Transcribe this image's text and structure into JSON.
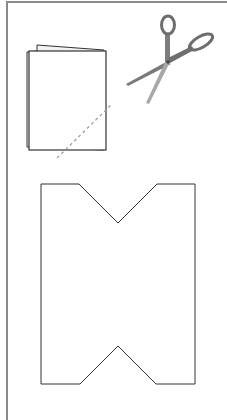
{
  "diagram": {
    "caption": "",
    "steps": [
      {
        "name": "folded-paper",
        "description": "Paper folded in half"
      },
      {
        "name": "scissors",
        "description": "Cut along dashed line"
      },
      {
        "name": "cut-shape",
        "description": "Unfolded shape with V notches at top and bottom"
      }
    ],
    "colors": {
      "frame": "#8a8a8a",
      "outline": "#333333",
      "dash": "#a0a0a0",
      "scissors_handle": "#6e6e6e",
      "scissors_blade": "#9a9a9a",
      "background": "#ffffff"
    }
  }
}
